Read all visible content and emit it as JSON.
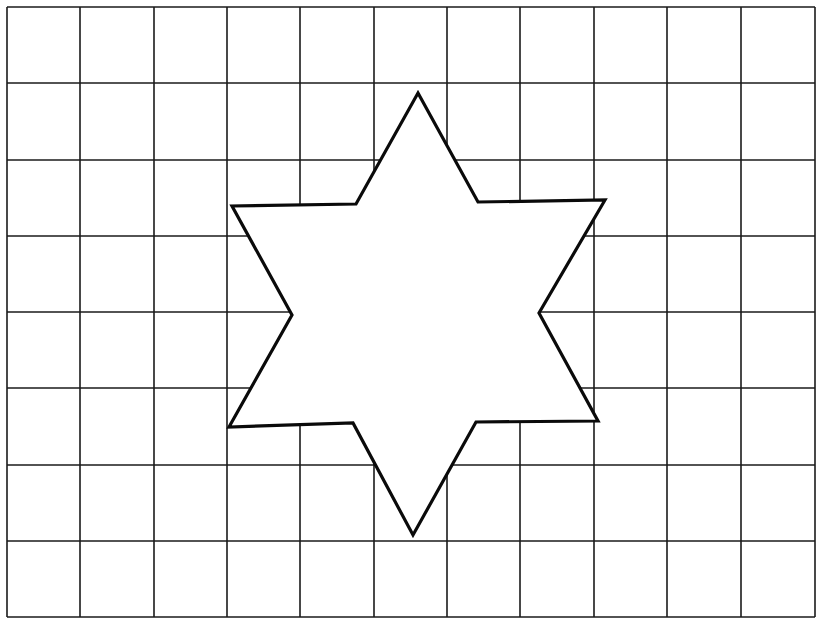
{
  "diagram": {
    "type": "grid-with-shape",
    "background": "#ffffff",
    "grid": {
      "columns": 11,
      "rows": 8,
      "x_lines": [
        7,
        80,
        154,
        227,
        300,
        374,
        447,
        520,
        594,
        667,
        741,
        815
      ],
      "y_lines": [
        7,
        83,
        160,
        236,
        312,
        388,
        465,
        541,
        617
      ],
      "stroke": "#1a1a1a",
      "stroke_width": 1.6
    },
    "shape": {
      "name": "six-pointed-star",
      "fill": "#ffffff",
      "stroke": "#0a0a0a",
      "stroke_width": 3.2,
      "points": [
        [
          418,
          93
        ],
        [
          478,
          202
        ],
        [
          605,
          200
        ],
        [
          539,
          313
        ],
        [
          598,
          421
        ],
        [
          476,
          422
        ],
        [
          413,
          535
        ],
        [
          353,
          423
        ],
        [
          229,
          427
        ],
        [
          292,
          315
        ],
        [
          232,
          206
        ],
        [
          356,
          204
        ]
      ]
    }
  }
}
